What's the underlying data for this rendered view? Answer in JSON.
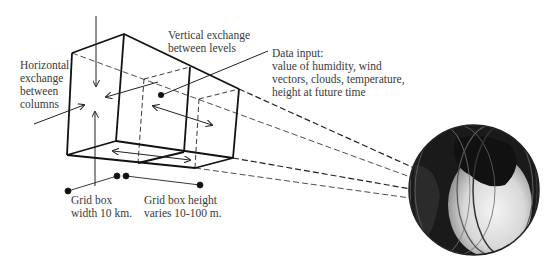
{
  "diagram": {
    "labels": {
      "vertical_exchange": "Vertical exchange\nbetween levels",
      "horizontal_exchange": "Horizontal\nexchange\nbetween\ncolumns",
      "data_input": "Data input:\nvalue of humidity, wind\nvectors, clouds, temperature,\nheight at future time",
      "grid_width": "Grid box\nwidth 10 km.",
      "grid_height": "Grid box height\nvaries 10-100 m."
    },
    "elements": {
      "grid_boxes": 2,
      "globe": "earth-globe"
    },
    "colors": {
      "line": "#111111",
      "text": "#3a3a3a",
      "globe_dark": "#1a1a1a",
      "globe_light": "#e8e8e8"
    }
  }
}
